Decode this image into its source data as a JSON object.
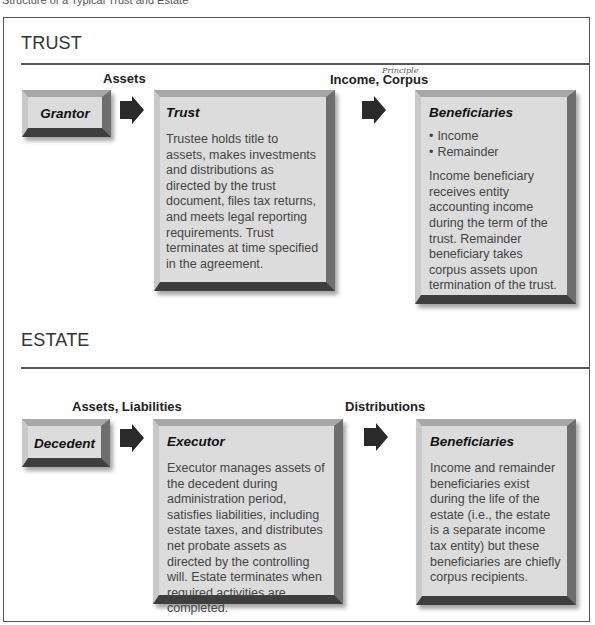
{
  "caption": "Structure of a Typical Trust and Estate",
  "trust": {
    "section_title": "TRUST",
    "flow_labels": {
      "assets": "Assets",
      "income_corpus": "Income, Corpus",
      "handwritten_note": "Principle"
    },
    "grantor": {
      "title": "Grantor"
    },
    "trust_box": {
      "title": "Trust",
      "body": "Trustee holds title to assets, makes investments and distributions as directed by the trust document, files tax returns, and meets legal reporting requirements. Trust terminates at time specified in the agreement."
    },
    "beneficiaries": {
      "title": "Beneficiaries",
      "bullets": [
        "Income",
        "Remainder"
      ],
      "body": "Income beneficiary receives entity accounting income during the term of the trust. Remainder beneficiary takes corpus assets upon termination of the trust."
    }
  },
  "estate": {
    "section_title": "ESTATE",
    "flow_labels": {
      "assets_liabilities": "Assets, Liabilities",
      "distributions": "Distributions"
    },
    "decedent": {
      "title": "Decedent"
    },
    "executor": {
      "title": "Executor",
      "body": "Executor manages assets of the decedent during administration period, satisfies liabilities, including estate taxes, and distributes net probate assets as directed by the controlling will. Estate terminates when required activities are completed."
    },
    "beneficiaries": {
      "title": "Beneficiaries",
      "body": "Income and remainder beneficiaries exist during the life of the estate (i.e., the estate is a separate income tax entity) but these beneficiaries are chiefly corpus recipients."
    }
  },
  "colors": {
    "box_fill": "#dcdcdc",
    "arrow": "#2a2a2a",
    "rule": "#555555"
  }
}
